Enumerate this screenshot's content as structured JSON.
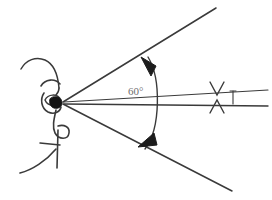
{
  "figure": {
    "type": "technical-line-drawing",
    "background_color": "#ffffff",
    "ink_color": "#3a3a3a",
    "label_color": "#6f6f6f",
    "width": 272,
    "height": 200
  },
  "annotations": {
    "angle_label": "60°",
    "angle_value": 60,
    "angle_unit": "degrees",
    "angle_label_x": 128,
    "angle_label_y": 85
  },
  "geometry": {
    "vertex": {
      "x": 62,
      "y": 103
    },
    "upper_ray_end": {
      "x": 216,
      "y": 8
    },
    "lower_ray_end": {
      "x": 232,
      "y": 191
    },
    "sight_upper_end": {
      "x": 268,
      "y": 92
    },
    "sight_lower_end": {
      "x": 268,
      "y": 107
    },
    "arc_radius": 96
  },
  "parts": {
    "head_outline": "head-profile-outline",
    "eye": "eye-pupil",
    "brow": "eyebrow-curve",
    "nose": "nose-curve",
    "mouth": "mouth-line",
    "chin": "chin-line",
    "upper_ray": "upper-sight-ray",
    "lower_ray": "lower-sight-ray",
    "sight_line_upper": "sight-wedge-upper-line",
    "sight_line_lower": "sight-wedge-lower-line",
    "angle_arc": "angle-arc",
    "arrow_top": "arc-arrowhead-top",
    "arrow_bottom": "arc-arrowhead-bottom",
    "target_upper": "target-cross-upper",
    "target_lower": "target-cross-lower",
    "target_tick": "target-vertical-tick"
  }
}
